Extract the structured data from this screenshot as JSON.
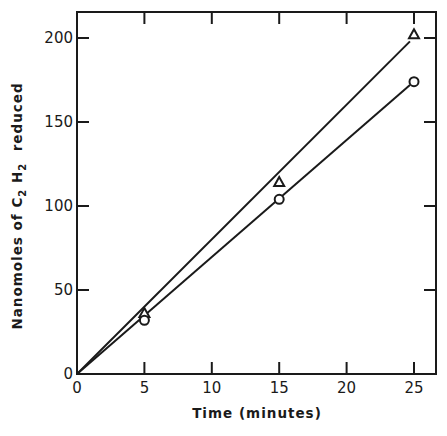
{
  "chart_data": {
    "type": "line",
    "title": "",
    "xlabel": "Time (minutes)",
    "ylabel_parts": {
      "pre": "Nanomoles of C",
      "sub1": "2",
      "mid": " H",
      "sub2": "2",
      "post": "  reduced"
    },
    "ylabel": "Nanomoles of C2 H2 reduced",
    "xlim": [
      0,
      26.7
    ],
    "ylim": [
      0,
      215
    ],
    "xticks": [
      0,
      5,
      10,
      15,
      20,
      25
    ],
    "yticks": [
      0,
      50,
      100,
      150,
      200
    ],
    "xtick_labels": [
      "0",
      "5",
      "10",
      "15",
      "20",
      "25"
    ],
    "ytick_labels": [
      "0",
      "50",
      "100",
      "150",
      "200"
    ],
    "grid": false,
    "legend": null,
    "frame": "box with ticks on all four sides",
    "series": [
      {
        "name": "triangle",
        "marker": "triangle",
        "x": [
          0,
          5,
          15,
          25
        ],
        "y": [
          0,
          36,
          114,
          202
        ],
        "fit_line": {
          "x": [
            0,
            24.7
          ],
          "y": [
            0,
            198
          ]
        }
      },
      {
        "name": "circle",
        "marker": "circle",
        "x": [
          0,
          5,
          15,
          25
        ],
        "y": [
          0,
          32,
          104,
          174
        ],
        "fit_line": {
          "x": [
            0,
            24.7
          ],
          "y": [
            0,
            172
          ]
        }
      }
    ]
  }
}
